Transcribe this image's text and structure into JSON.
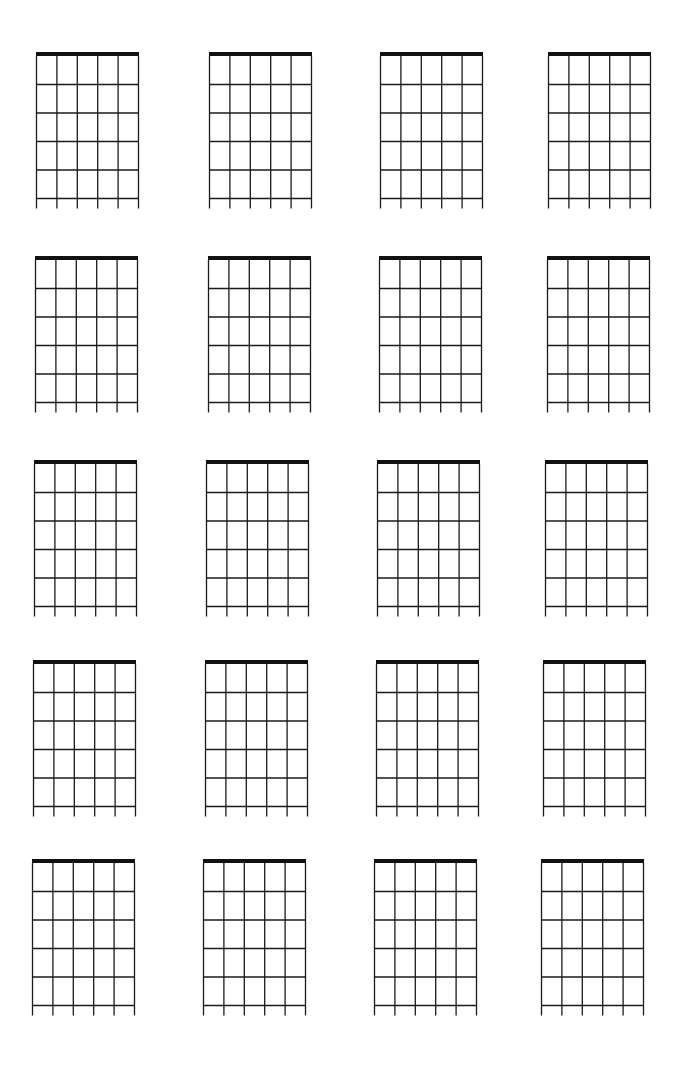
{
  "document": {
    "type": "blank guitar chord chart sheet",
    "rows": 5,
    "columns": 4,
    "diagram_count": 20,
    "strings_per_diagram": 6,
    "frets_per_diagram": 5,
    "line_color": "#1a1a1a",
    "nut_color": "#111111",
    "background_color": "#ffffff"
  }
}
